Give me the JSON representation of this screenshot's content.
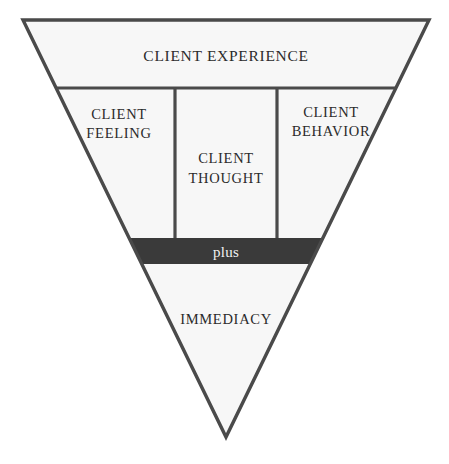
{
  "figure": {
    "caption": "FIGURE 9  FOCUSES",
    "shape": "inverted-triangle",
    "colors": {
      "page_background": "#ffffff",
      "triangle_fill": "#f7f7f7",
      "outline": "#4a4a4a",
      "plus_band_fill": "#3a3a3a",
      "plus_band_text": "#f2f2f2",
      "label_text": "#2b2b2b"
    },
    "geometry": {
      "top_left_x": 23,
      "top_right_x": 429,
      "top_y": 20,
      "apex_x": 226,
      "apex_y": 437,
      "divider_row1_y": 88,
      "divider_row2_y": 238,
      "divider_row3_y": 264,
      "column_divider_left_x": 175,
      "column_divider_right_x": 277
    },
    "sections": [
      {
        "id": "client-experience",
        "label": "CLIENT EXPERIENCE",
        "kind": "band",
        "row": 1
      },
      {
        "id": "client-feeling",
        "label_line1": "CLIENT",
        "label_line2": "FEELING",
        "kind": "column",
        "row": 2,
        "column": 1
      },
      {
        "id": "client-thought",
        "label_line1": "CLIENT",
        "label_line2": "THOUGHT",
        "kind": "column",
        "row": 2,
        "column": 2
      },
      {
        "id": "client-behavior",
        "label_line1": "CLIENT",
        "label_line2": "BEHAVIOR",
        "kind": "column",
        "row": 2,
        "column": 3
      },
      {
        "id": "plus",
        "label": "plus",
        "kind": "band-dark",
        "row": 3
      },
      {
        "id": "immediacy",
        "label": "IMMEDIACY",
        "kind": "apex",
        "row": 4
      }
    ]
  }
}
